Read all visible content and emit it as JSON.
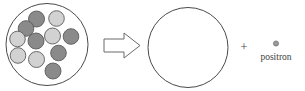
{
  "diagram": {
    "type": "nuclear-decay-reaction",
    "colors": {
      "outline": "#4a4a4a",
      "proton_fill": "#8a8a8a",
      "neutron_fill": "#d2d2d2",
      "particle_stroke": "#5a5a5a",
      "arrow_stroke": "#6b6b6b",
      "arrow_fill": "#ffffff",
      "text": "#3d3d3d",
      "background": "#ffffff"
    },
    "reactant": {
      "name": "parent-nucleus",
      "circle": {
        "cx": 47,
        "cy": 44.5,
        "r": 41
      },
      "particles": [
        {
          "name": "nucleon-1",
          "kind": "proton",
          "cx": 36.5,
          "cy": 19.0,
          "r": 8.0
        },
        {
          "name": "nucleon-2",
          "kind": "neutron",
          "cx": 56.5,
          "cy": 18.5,
          "r": 7.8
        },
        {
          "name": "nucleon-3",
          "kind": "proton",
          "cx": 26.0,
          "cy": 28.5,
          "r": 7.8
        },
        {
          "name": "nucleon-4",
          "kind": "neutron",
          "cx": 17.5,
          "cy": 39.0,
          "r": 7.8
        },
        {
          "name": "nucleon-5",
          "kind": "neutron",
          "cx": 52.5,
          "cy": 36.0,
          "r": 8.0
        },
        {
          "name": "nucleon-6",
          "kind": "proton",
          "cx": 71.0,
          "cy": 36.5,
          "r": 7.8
        },
        {
          "name": "nucleon-7",
          "kind": "proton",
          "cx": 36.0,
          "cy": 41.0,
          "r": 8.0
        },
        {
          "name": "nucleon-8",
          "kind": "neutron",
          "cx": 18.0,
          "cy": 55.5,
          "r": 7.8
        },
        {
          "name": "nucleon-9",
          "kind": "proton",
          "cx": 58.5,
          "cy": 53.0,
          "r": 7.8
        },
        {
          "name": "nucleon-10",
          "kind": "neutron",
          "cx": 36.5,
          "cy": 59.5,
          "r": 8.0
        },
        {
          "name": "nucleon-11",
          "kind": "proton",
          "cx": 53.0,
          "cy": 71.0,
          "r": 8.0
        }
      ]
    },
    "arrow": {
      "name": "reaction-arrow",
      "direction": "right",
      "points": "104,39 124,39 124,33 140,45.5 124,58 124,52 104,52"
    },
    "product": {
      "name": "daughter-nucleus",
      "circle": {
        "cx": 188,
        "cy": 47.5,
        "r": 40
      }
    },
    "plus": {
      "symbol": "+",
      "x": 244,
      "y": 51
    },
    "positron": {
      "label": "positron",
      "dot": {
        "cx": 276,
        "cy": 43.5,
        "r": 2.6
      },
      "label_x": 276,
      "label_y": 60
    }
  }
}
